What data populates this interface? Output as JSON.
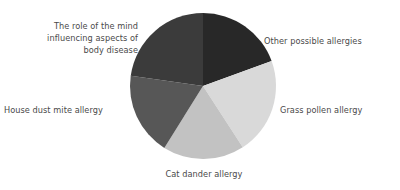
{
  "chart_data": {
    "type": "pie",
    "title": "",
    "subtitle": "",
    "xlabel": "",
    "ylabel": "",
    "legend_position": "none",
    "grid": false,
    "labels_outside": true,
    "start_angle_deg": 0,
    "direction": "clockwise",
    "center": {
      "x": 203,
      "y": 86
    },
    "radius": 73,
    "categories": [
      "Other possible allergies",
      "Grass pollen allergy",
      "Cat dander allergy",
      "House dust mite allergy",
      "The role of the mind influencing aspects of body disease"
    ],
    "values": [
      19.5,
      21.5,
      18.0,
      18.5,
      22.5
    ],
    "slices": [
      {
        "label": "Other possible allergies",
        "label_lines": "Other possible allergies",
        "value": 19.5,
        "color": "#282828",
        "start_deg": 0,
        "end_deg": 70
      },
      {
        "label": "Grass pollen allergy",
        "label_lines": "Grass pollen allergy",
        "value": 21.5,
        "color": "#d9d9d9",
        "start_deg": 70,
        "end_deg": 147
      },
      {
        "label": "Cat dander allergy",
        "label_lines": "Cat dander allergy",
        "value": 18.0,
        "color": "#c2c2c2",
        "start_deg": 147,
        "end_deg": 212
      },
      {
        "label": "House dust mite allergy",
        "label_lines": "House dust mite allergy",
        "value": 18.5,
        "color": "#575757",
        "start_deg": 212,
        "end_deg": 278
      },
      {
        "label": "The role of the mind influencing aspects of body disease",
        "label_lines": "The role of the mind\ninfluencing aspects of\nbody disease",
        "value": 22.5,
        "color": "#3b3b3b",
        "start_deg": 278,
        "end_deg": 360
      }
    ]
  },
  "figure": {
    "background": "#ffffff",
    "label_color": "#4a4a4a"
  }
}
